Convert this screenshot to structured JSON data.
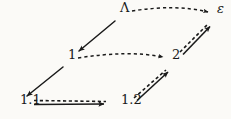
{
  "diagram": {
    "background_color": "#fbfaf7",
    "ink_color": "#1a1a1a",
    "nodes": [
      {
        "id": "lambda",
        "label": "Λ",
        "x": 120,
        "y": 13,
        "style": "upright"
      },
      {
        "id": "epsilon",
        "label": "ε",
        "x": 217,
        "y": 14,
        "style": "italic"
      },
      {
        "id": "one",
        "label": "1",
        "x": 68,
        "y": 60,
        "style": "upright"
      },
      {
        "id": "two",
        "label": "2",
        "x": 172,
        "y": 60,
        "style": "upright"
      },
      {
        "id": "onepone",
        "label": "1.1",
        "x": 20,
        "y": 105,
        "style": "upright"
      },
      {
        "id": "oneptwo",
        "label": "1.2",
        "x": 121,
        "y": 105,
        "style": "upright"
      }
    ],
    "edges": [
      {
        "id": "lambda-to-epsilon",
        "from": "lambda",
        "to": "epsilon",
        "kind": "dashed-single",
        "label": ""
      },
      {
        "id": "lambda-to-one",
        "from": "lambda",
        "to": "one",
        "kind": "solid-single",
        "label": ""
      },
      {
        "id": "one-to-two",
        "from": "one",
        "to": "two",
        "kind": "dashed-single",
        "label": ""
      },
      {
        "id": "one-to-onepone",
        "from": "one",
        "to": "onepone",
        "kind": "solid-single",
        "label": ""
      },
      {
        "id": "onepone-to-oneptwo",
        "from": "onepone",
        "to": "oneptwo",
        "kind": "double",
        "label": ""
      },
      {
        "id": "oneptwo-to-two",
        "from": "oneptwo",
        "to": "two",
        "kind": "double",
        "label": ""
      },
      {
        "id": "two-to-epsilon",
        "from": "two",
        "to": "epsilon",
        "kind": "double",
        "label": ""
      }
    ]
  }
}
